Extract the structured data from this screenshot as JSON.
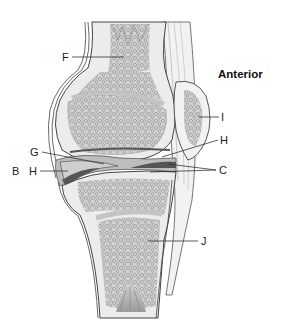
{
  "diagram": {
    "orientation_label": "Anterior",
    "labels": [
      {
        "id": "F",
        "text": "F",
        "points_to": "femur diaphysis / medullary region"
      },
      {
        "id": "G",
        "text": "G",
        "points_to": "articular cartilage"
      },
      {
        "id": "B",
        "text": "B",
        "points_to": "joint capsule (posterior)"
      },
      {
        "id": "H-left",
        "text": "H",
        "points_to": "joint cavity / meniscus (posterior)"
      },
      {
        "id": "I",
        "text": "I",
        "points_to": "patella"
      },
      {
        "id": "H-right",
        "text": "H",
        "points_to": "joint cavity (anterior)"
      },
      {
        "id": "C",
        "text": "C",
        "points_to": "ligaments / menisci (anterior)"
      },
      {
        "id": "J",
        "text": "J",
        "points_to": "tibia spongy bone"
      }
    ],
    "colors": {
      "bone_fill": "#e9e9e9",
      "spongy_bone": "#cfcfcf",
      "spongy_dots": "#8a8a8a",
      "cartilage": "#f4f4f4",
      "cavity": "#bdbdbd",
      "meniscus_dark": "#555555",
      "outline": "#444444",
      "soft_tissue": "#f0f0f0"
    }
  }
}
